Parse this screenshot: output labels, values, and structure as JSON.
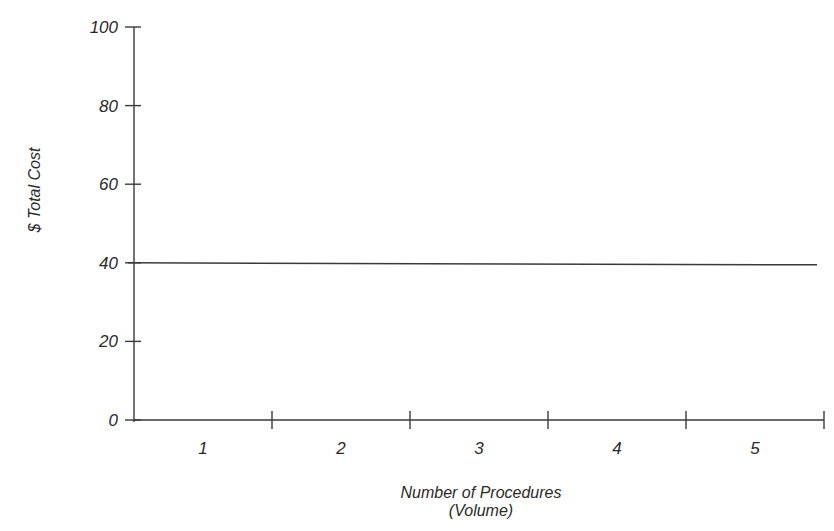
{
  "chart_data": {
    "type": "line",
    "title": "",
    "xlabel": "Number of Procedures",
    "xlabel_sub": "(Volume)",
    "ylabel": "$ Total Cost",
    "categories": [
      "1",
      "2",
      "3",
      "4",
      "5"
    ],
    "series": [
      {
        "name": "Total Cost",
        "values": [
          40,
          40,
          40,
          40,
          40
        ]
      }
    ],
    "yticks": [
      "0",
      "20",
      "40",
      "60",
      "80",
      "100"
    ],
    "ylim": [
      0,
      100
    ],
    "grid": false,
    "legend": "none",
    "colors": {
      "axis": "#3a3a3a",
      "line": "#3a3a3a",
      "text": "#2a2a2a"
    }
  }
}
